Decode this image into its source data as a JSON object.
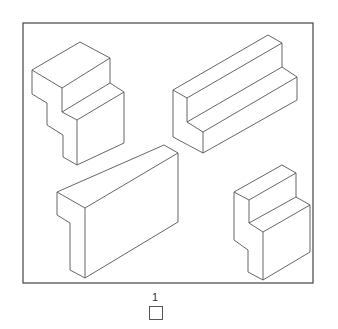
{
  "figure": {
    "shapes": [
      {
        "id": "shape-top-left",
        "type": "stepped block (L-profile extrusion with notch)"
      },
      {
        "id": "shape-top-right",
        "type": "L-profile long bar"
      },
      {
        "id": "shape-bottom-left",
        "type": "rectangular slab with notch"
      },
      {
        "id": "shape-bottom-right",
        "type": "stepped block"
      }
    ],
    "answer": {
      "label": "1"
    },
    "colors": {
      "line": "#555555",
      "background": "#ffffff"
    }
  }
}
